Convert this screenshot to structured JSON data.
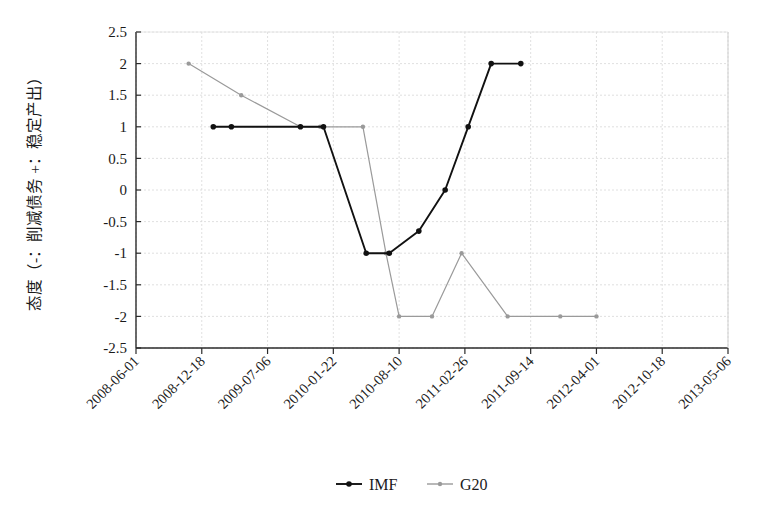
{
  "chart_data": {
    "type": "line",
    "title": "",
    "xlabel": "",
    "ylabel": "态度（-：削减债务 +：稳定产出）",
    "ylim": [
      -2.5,
      2.5
    ],
    "xlim": [
      "2008-06-01",
      "2013-05-06"
    ],
    "grid": true,
    "legend_position": "bottom",
    "ytick_labels": [
      "2.5",
      "2",
      "1.5",
      "1",
      "0.5",
      "0",
      "-0.5",
      "-1",
      "-1.5",
      "-2",
      "-2.5"
    ],
    "ytick_values": [
      2.5,
      2,
      1.5,
      1,
      0.5,
      0,
      -0.5,
      -1,
      -1.5,
      -2,
      -2.5
    ],
    "xtick_labels": [
      "2008-06-01",
      "2008-12-18",
      "2009-07-06",
      "2010-01-22",
      "2010-08-10",
      "2011-02-26",
      "2011-09-14",
      "2012-04-01",
      "2012-10-18",
      "2013-05-06"
    ],
    "xtick_positions": [
      0,
      200,
      400,
      600,
      800,
      1000,
      1200,
      1400,
      1600,
      1800
    ],
    "series": [
      {
        "name": "IMF",
        "color": "#111111",
        "marker": "circle",
        "x": [
          235,
          290,
          420,
          500,
          570,
          640,
          700,
          770,
          860,
          940,
          1010,
          1080
        ],
        "y": [
          1,
          1,
          1,
          1,
          -1,
          -1,
          -0.65,
          0,
          1,
          2,
          2,
          2
        ],
        "points": [
          {
            "x": 235,
            "y": 1
          },
          {
            "x": 290,
            "y": 1
          },
          {
            "x": 500,
            "y": 1
          },
          {
            "x": 570,
            "y": 1
          },
          {
            "x": 700,
            "y": -1
          },
          {
            "x": 770,
            "y": -1
          },
          {
            "x": 860,
            "y": -0.65
          },
          {
            "x": 940,
            "y": 0
          },
          {
            "x": 1010,
            "y": 1
          },
          {
            "x": 1080,
            "y": 2
          },
          {
            "x": 1170,
            "y": 2
          }
        ]
      },
      {
        "name": "G20",
        "color": "#9a9a9a",
        "marker": "circle",
        "points": [
          {
            "x": 160,
            "y": 2
          },
          {
            "x": 320,
            "y": 1.5
          },
          {
            "x": 500,
            "y": 1
          },
          {
            "x": 560,
            "y": 1
          },
          {
            "x": 690,
            "y": 1
          },
          {
            "x": 760,
            "y": -1
          },
          {
            "x": 800,
            "y": -2
          },
          {
            "x": 900,
            "y": -2
          },
          {
            "x": 990,
            "y": -1
          },
          {
            "x": 1130,
            "y": -2
          },
          {
            "x": 1290,
            "y": -2
          },
          {
            "x": 1400,
            "y": -2
          }
        ]
      }
    ]
  },
  "legend": {
    "items": [
      {
        "label": "IMF",
        "color": "#111111"
      },
      {
        "label": "G20",
        "color": "#9a9a9a"
      }
    ]
  }
}
